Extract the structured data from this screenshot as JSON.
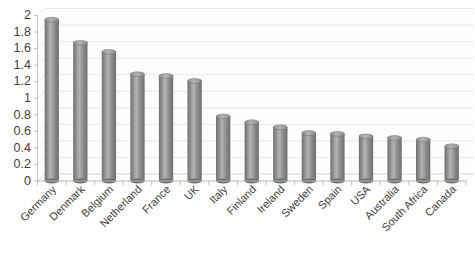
{
  "chart_data": {
    "type": "bar",
    "title": "",
    "subtitle": "",
    "xlabel": "",
    "ylabel": "",
    "ylim": [
      0,
      2
    ],
    "grid": true,
    "legend": null,
    "legend_position": "none",
    "bar_style": "cylinder-3d",
    "bar_color": "#8c8c8c",
    "bar_color_light": "#b4b4b4",
    "bar_color_dark": "#6e6e6e",
    "grid_color": "#e3e3e3",
    "axis_color": "#bdbdbd",
    "label_rotation_deg": -45,
    "categories": [
      "Germany",
      "Denmark",
      "Belgium",
      "Netherland",
      "France",
      "UK",
      "Italy",
      "Finland",
      "Ireland",
      "Sweden",
      "Spain",
      "USA",
      "Australia",
      "South Africa",
      "Canada"
    ],
    "values": [
      1.95,
      1.67,
      1.56,
      1.29,
      1.27,
      1.21,
      0.78,
      0.71,
      0.65,
      0.58,
      0.57,
      0.54,
      0.52,
      0.5,
      0.42
    ],
    "yticks": [
      0,
      0.2,
      0.4,
      0.6,
      0.8,
      1,
      1.2,
      1.4,
      1.6,
      1.8,
      2
    ],
    "ytick_labels": [
      "0",
      "0.2",
      "0.4",
      "0.6",
      "0.8",
      "1",
      "1.2",
      "1.4",
      "1.6",
      "1.8",
      "2"
    ]
  }
}
